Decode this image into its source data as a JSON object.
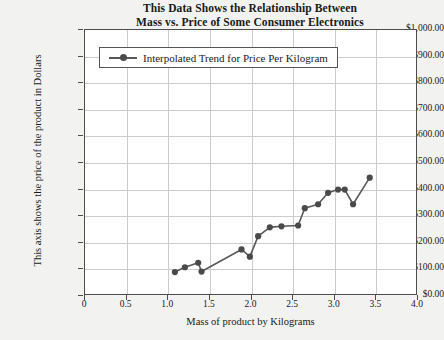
{
  "chart_data": {
    "type": "line",
    "title": "This Data Shows the Relationship Between Mass vs. Price of Some Consumer Electronics",
    "title_lines": [
      "This Data Shows the Relationship Between",
      "Mass vs. Price of Some Consumer Electronics"
    ],
    "xlabel": "Mass of product by Kilograms",
    "ylabel": "This axis shows the price of the product in Dollars",
    "xlim": [
      0,
      4.0
    ],
    "ylim": [
      0,
      1000
    ],
    "grid": true,
    "legend_position": "top-left-inside",
    "legend": [
      "Interpolated Trend for Price Per Kilogram"
    ],
    "series": [
      {
        "name": "Interpolated Trend for Price Per Kilogram",
        "color": "#595959",
        "marker": "circle",
        "x": [
          1.08,
          1.2,
          1.36,
          1.4,
          1.88,
          1.98,
          2.08,
          2.22,
          2.36,
          2.56,
          2.64,
          2.8,
          2.92,
          3.04,
          3.12,
          3.22,
          3.42
        ],
        "values": [
          90,
          108,
          125,
          92,
          175,
          148,
          225,
          258,
          262,
          265,
          330,
          345,
          388,
          400,
          400,
          345,
          445
        ]
      }
    ],
    "x_ticks": [
      "0",
      "0.5",
      "1.0",
      "1.5",
      "2.0",
      "2.5",
      "3.0",
      "3.5",
      "4.0"
    ],
    "x_tick_values": [
      0,
      0.5,
      1.0,
      1.5,
      2.0,
      2.5,
      3.0,
      3.5,
      4.0
    ],
    "y_ticks": [
      "$0.00",
      "$100.00",
      "$200.00",
      "$300.00",
      "$400.00",
      "$500.00",
      "$600.00",
      "$700.00",
      "$800.00",
      "$900.00",
      "$1,000.00"
    ],
    "y_tick_values": [
      0,
      100,
      200,
      300,
      400,
      500,
      600,
      700,
      800,
      900,
      1000
    ]
  }
}
